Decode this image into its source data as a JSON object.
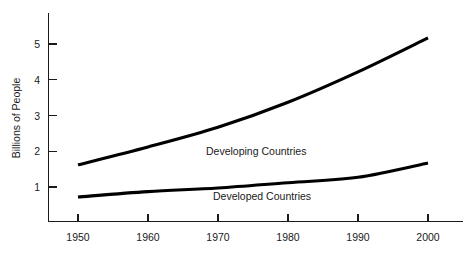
{
  "chart_data": {
    "type": "line",
    "title": "",
    "subtitle": "",
    "xlabel": "",
    "ylabel": "Billions of People",
    "xlim": [
      1946,
      2004
    ],
    "ylim": [
      0,
      5.6
    ],
    "grid": false,
    "legend_position": "inline-annotations",
    "x_ticks": [
      1950,
      1960,
      1970,
      1980,
      1990,
      2000
    ],
    "x_tick_labels": [
      "1950",
      "1960",
      "1970",
      "1980",
      "1990",
      "2000"
    ],
    "y_ticks": [
      1,
      2,
      3,
      4,
      5
    ],
    "y_tick_labels": [
      "1",
      "2",
      "3",
      "4",
      "5"
    ],
    "x": [
      1950,
      1960,
      1970,
      1980,
      1990,
      2000
    ],
    "series": [
      {
        "name": "Developing Countries",
        "values": [
          1.6,
          2.1,
          2.65,
          3.35,
          4.2,
          5.15
        ],
        "color": "#000000",
        "annotation": "Developing Countries"
      },
      {
        "name": "Developed Countries",
        "values": [
          0.7,
          0.85,
          0.95,
          1.1,
          1.25,
          1.65
        ],
        "color": "#000000",
        "annotation": "Developed Countries"
      }
    ],
    "annotations": [
      {
        "text": "Developing Countries",
        "x": 1970,
        "y": 2.0
      },
      {
        "text": "Developed Countries",
        "x": 1972,
        "y": 0.75
      }
    ]
  },
  "axes": {
    "y_title": "Billions of People",
    "y_tick_1": "1",
    "y_tick_2": "2",
    "y_tick_3": "3",
    "y_tick_4": "4",
    "y_tick_5": "5",
    "x_tick_1950": "1950",
    "x_tick_1960": "1960",
    "x_tick_1970": "1970",
    "x_tick_1980": "1980",
    "x_tick_1990": "1990",
    "x_tick_2000": "2000"
  },
  "labels": {
    "developing": "Developing Countries",
    "developed": "Developed Countries"
  },
  "colors": {
    "line": "#000000",
    "axis": "#1a1a1a",
    "background": "#ffffff",
    "text": "#1a1a1a"
  }
}
